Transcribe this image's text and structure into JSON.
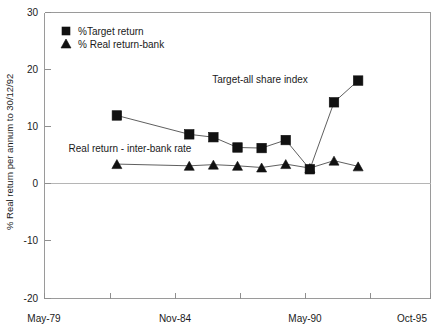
{
  "chart_data": {
    "type": "line",
    "title": "",
    "xlabel": "",
    "ylabel": "% Real return per annum to 30/12/92",
    "ylim": [
      -20,
      30
    ],
    "yticks": [
      30,
      20,
      10,
      0,
      -10,
      -20
    ],
    "ytick_labels": [
      "30",
      "20",
      "10",
      "0",
      "-10",
      "-20"
    ],
    "xlim": [
      0,
      16
    ],
    "xtick_labels": [
      "May-79",
      "Nov-84",
      "May-90",
      "Oct-95"
    ],
    "xtick_positions": [
      0,
      5.5,
      11,
      16
    ],
    "grid": false,
    "legend_position": "top-left",
    "x": [
      3,
      6,
      7,
      8,
      9,
      10,
      11,
      12,
      13
    ],
    "series": [
      {
        "name": "%Target return",
        "marker": "square",
        "values": [
          12.0,
          8.7,
          8.2,
          6.4,
          6.3,
          7.7,
          2.6,
          14.3,
          18.1
        ]
      },
      {
        "name": "% Real return-bank",
        "marker": "triangle",
        "values": [
          3.5,
          3.2,
          3.4,
          3.2,
          2.9,
          3.5,
          2.8,
          4.1,
          3.1
        ]
      }
    ],
    "annotations": [
      {
        "text": "Target-all share index",
        "x_px": 260,
        "y_px": 83
      },
      {
        "text": "Real return - inter-bank rate",
        "x_px": 130,
        "y_px": 152
      }
    ]
  },
  "legend": {
    "items": [
      {
        "label": "%Target return",
        "marker": "square"
      },
      {
        "label": "% Real return-bank",
        "marker": "triangle"
      }
    ]
  },
  "axes": {
    "y_title": "% Real return per annum to 30/12/92",
    "y_labels": {
      "t0": "30",
      "t1": "20",
      "t2": "10",
      "t3": "0",
      "t4": "-10",
      "t5": "-20"
    },
    "x_labels": {
      "t0": "May-79",
      "t1": "Nov-84",
      "t2": "May-90",
      "t3": "Oct-95"
    }
  },
  "annotations": {
    "target_all_share": "Target-all share index",
    "real_return_interbank": "Real return - inter-bank rate"
  }
}
